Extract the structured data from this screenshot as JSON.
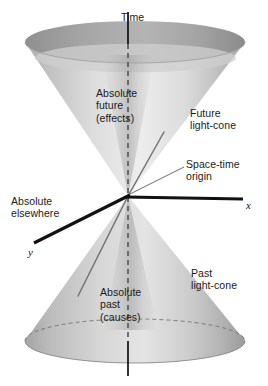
{
  "figure": {
    "kind": "light-cone-spacetime-diagram",
    "background": "#ffffff",
    "cone_fill_light": "#e4e4e4",
    "cone_fill_mid": "#c9c9c9",
    "cone_fill_dark": "#9c9c9c",
    "axis_color": "#111111",
    "text_color": "#1a1a1a",
    "dashed_color": "#4d4d4d",
    "worldline_color": "#6f6f6f"
  },
  "labels": {
    "time": "Time",
    "absolute_future": "Absolute\nfuture\n(effects)",
    "future_light_cone": "Future\nlight-cone",
    "spacetime_origin": "Space-time\norigin",
    "absolute_elsewhere": "Absolute\nelsewhere",
    "x_axis": "x",
    "y_axis": "y",
    "past_light_cone": "Past\nlight-cone",
    "absolute_past": "Absolute\npast\n(causes)"
  },
  "geometry": {
    "apex": {
      "x": 128,
      "y": 196
    },
    "future_cone_top_ellipse": {
      "cx": 135,
      "cy": 49,
      "rx": 110,
      "ry": 21
    },
    "past_cone_base_ellipse": {
      "cx": 135,
      "cy": 341,
      "rx": 110,
      "ry": 22
    },
    "time_axis": {
      "x1": 128,
      "y1": 12,
      "x2": 128,
      "y2": 376
    },
    "x_axis": {
      "x1": 128,
      "y1": 196,
      "x2": 243,
      "y2": 199
    },
    "y_axis": {
      "x1": 128,
      "y1": 196,
      "x2": 34,
      "y2": 243
    },
    "worldline_future": {
      "x1": 128,
      "y1": 196,
      "x2": 164,
      "y2": 132
    },
    "worldline_past": {
      "x1": 128,
      "y1": 196,
      "x2": 78,
      "y2": 296
    },
    "origin_pointer": {
      "x1": 183,
      "y1": 166,
      "x2": 131,
      "y2": 194
    }
  }
}
